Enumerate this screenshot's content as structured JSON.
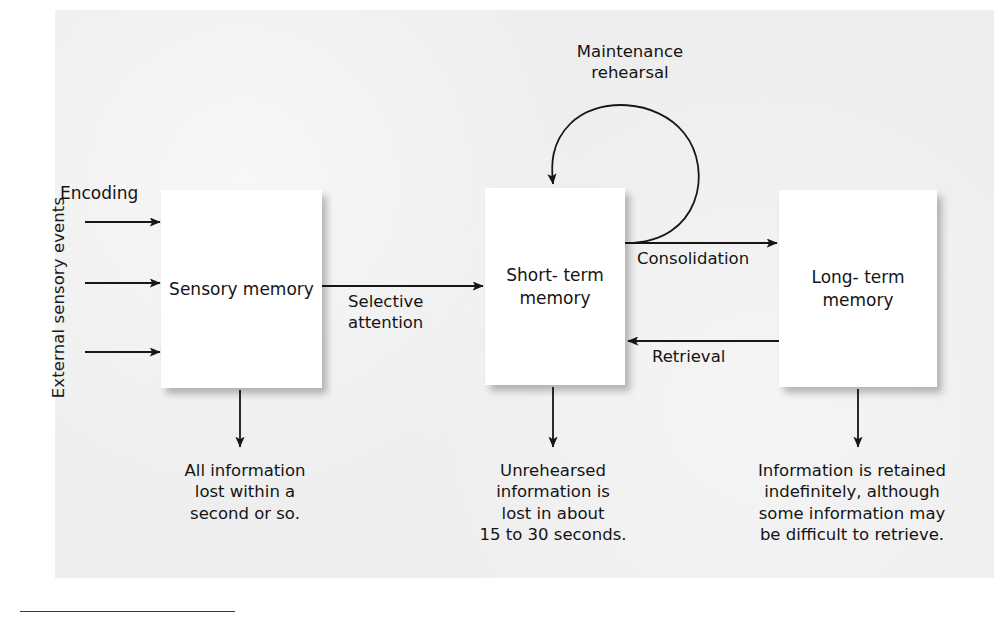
{
  "diagram": {
    "axis_label": "External sensory events",
    "boxes": [
      {
        "id": "sensory",
        "label": "Sensory\nmemory"
      },
      {
        "id": "short_term",
        "label": "Short-\nterm\nmemory"
      },
      {
        "id": "long_term",
        "label": "Long-\nterm\nmemory"
      }
    ],
    "flow_labels": {
      "encoding": "Encoding",
      "selective_attention": "Selective\nattention",
      "maintenance_rehearsal": "Maintenance\nrehearsal",
      "consolidation": "Consolidation",
      "retrieval": "Retrieval"
    },
    "captions": [
      {
        "id": "sensory",
        "text": "All information\nlost within a\nsecond or so."
      },
      {
        "id": "short_term",
        "text": "Unrehearsed\ninformation is\nlost in about\n15 to 30 seconds."
      },
      {
        "id": "long_term",
        "text": "Information is retained\nindefinitely, although\nsome information may\nbe difficult to retrieve."
      }
    ],
    "colors": {
      "panel_background": "#eeeeee",
      "box_fill": "#ffffff",
      "ink": "#141414",
      "page_background": "#ffffff"
    }
  }
}
